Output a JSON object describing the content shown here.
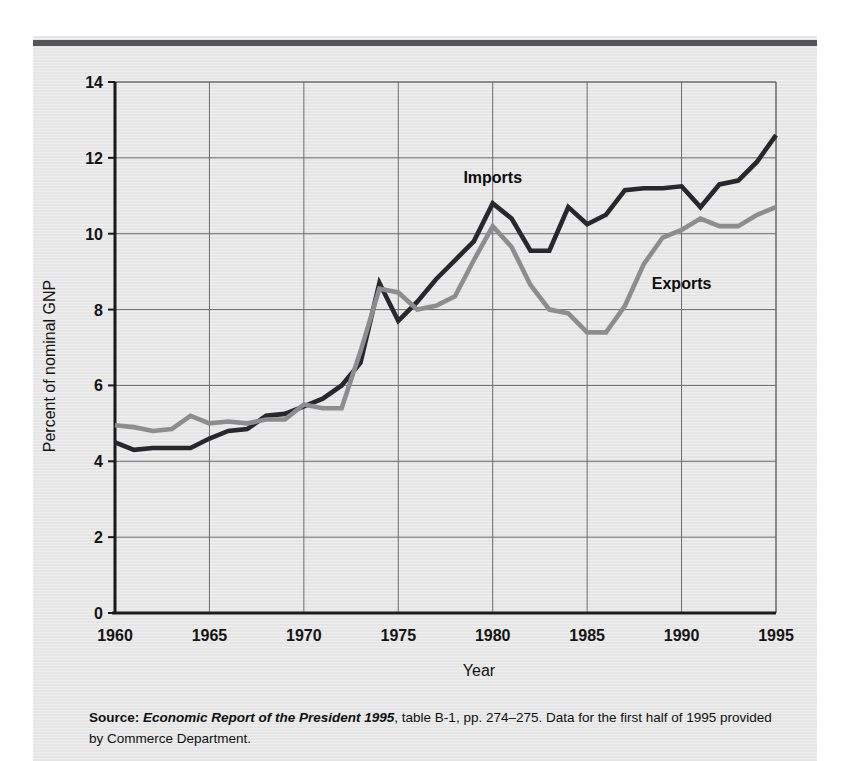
{
  "figure": {
    "source_prefix": "Source:",
    "source_italic": "Economic Report of the President 1995",
    "source_rest": ", table B-1, pp. 274–275. Data for the first half of 1995 provided by Commerce Department."
  },
  "chart_data": {
    "type": "line",
    "title": "",
    "xlabel": "Year",
    "ylabel": "Percent of nominal GNP",
    "xlim": [
      1960,
      1995
    ],
    "ylim": [
      0,
      14
    ],
    "xticks": [
      1960,
      1965,
      1970,
      1975,
      1980,
      1985,
      1990,
      1995
    ],
    "yticks": [
      0,
      2,
      4,
      6,
      8,
      10,
      12,
      14
    ],
    "grid": true,
    "legend_position": "inline-annotations",
    "x": [
      1960,
      1961,
      1962,
      1963,
      1964,
      1965,
      1966,
      1967,
      1968,
      1969,
      1970,
      1971,
      1972,
      1973,
      1974,
      1975,
      1976,
      1977,
      1978,
      1979,
      1980,
      1981,
      1982,
      1983,
      1984,
      1985,
      1986,
      1987,
      1988,
      1989,
      1990,
      1991,
      1992,
      1993,
      1994,
      1995
    ],
    "series": [
      {
        "name": "Imports",
        "color": "#28282c",
        "values": [
          4.5,
          4.3,
          4.35,
          4.35,
          4.35,
          4.6,
          4.8,
          4.85,
          5.2,
          5.25,
          5.45,
          5.65,
          6.0,
          6.6,
          8.7,
          7.7,
          8.2,
          8.8,
          9.3,
          9.8,
          10.8,
          10.4,
          9.55,
          9.55,
          10.7,
          10.25,
          10.5,
          11.15,
          11.2,
          11.2,
          11.25,
          10.7,
          11.3,
          11.4,
          11.9,
          12.6
        ]
      },
      {
        "name": "Exports",
        "color": "#8d8d8f",
        "values": [
          4.95,
          4.9,
          4.8,
          4.85,
          5.2,
          5.0,
          5.05,
          5.0,
          5.1,
          5.1,
          5.5,
          5.4,
          5.4,
          6.9,
          8.55,
          8.45,
          8.0,
          8.1,
          8.35,
          9.3,
          10.2,
          9.65,
          8.65,
          8.0,
          7.9,
          7.4,
          7.4,
          8.1,
          9.2,
          9.9,
          10.1,
          10.4,
          10.2,
          10.2,
          10.5,
          10.7
        ]
      }
    ],
    "annotations": [
      {
        "text": "Imports",
        "x": 1980,
        "y": 11.35
      },
      {
        "text": "Exports",
        "x": 1990,
        "y": 8.55
      }
    ]
  }
}
